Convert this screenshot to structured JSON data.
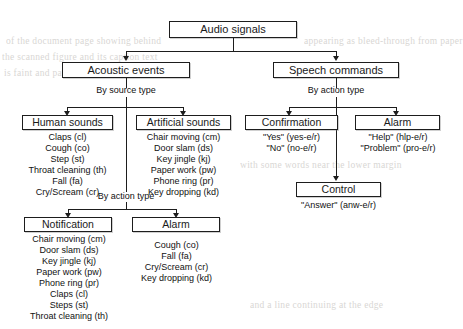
{
  "diagram": {
    "root": {
      "label": "Audio signals"
    },
    "level2": [
      {
        "label": "Acoustic events"
      },
      {
        "label": "Speech commands"
      }
    ],
    "edge_labels": {
      "by_source_type": "By source type",
      "by_action_type_left": "By action type",
      "by_action_type_right": "By action type",
      "by_action_type_acoustic": "By action type"
    },
    "groups": {
      "human_sounds": {
        "label": "Human sounds",
        "items": [
          "Claps (cl)",
          "Cough (co)",
          "Step (st)",
          "Throat cleaning (th)",
          "Fall (fa)",
          "Cry/Scream (cr)"
        ]
      },
      "artificial_sounds": {
        "label": "Artificial sounds",
        "items": [
          "Chair moving (cm)",
          "Door slam (ds)",
          "Key jingle (kj)",
          "Paper work (pw)",
          "Phone ring (pr)",
          "Key dropping (kd)"
        ]
      },
      "confirmation": {
        "label": "Confirmation",
        "items": [
          "\"Yes\" (yes-e/r)",
          "\"No\" (no-e/r)"
        ]
      },
      "alarm_speech": {
        "label": "Alarm",
        "items": [
          "\"Help\" (hlp-e/r)",
          "\"Problem\" (pro-e/r)"
        ]
      },
      "control": {
        "label": "Control",
        "items": [
          "\"Answer\" (anw-e/r)"
        ]
      },
      "notification": {
        "label": "Notification",
        "items": [
          "Chair moving (cm)",
          "Door slam (ds)",
          "Key jingle (kj)",
          "Paper work (pw)",
          "Phone ring (pr)",
          "Claps (cl)",
          "Steps (st)",
          "Throat cleaning (th)"
        ]
      },
      "alarm_acoustic": {
        "label": "Alarm",
        "items": [
          "Cough (co)",
          "Fall (fa)",
          "Cry/Scream (cr)",
          "Key dropping (kd)"
        ]
      }
    },
    "background_text": [
      "of the document page showing behind",
      "the scanned figure and its caption text",
      "is faint and partially legible only",
      "appearing as bleed-through from paper",
      "with some words near the lower margin",
      "and a line continuing at the edge"
    ]
  }
}
